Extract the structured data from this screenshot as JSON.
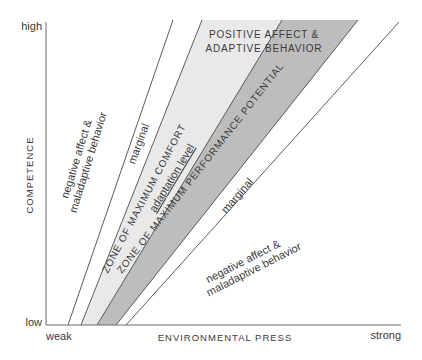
{
  "diagram": {
    "axes": {
      "y_label": "COMPETENCE",
      "y_high": "high",
      "y_low": "low",
      "x_label": "ENVIRONMENTAL PRESS",
      "x_weak": "weak",
      "x_strong": "strong"
    },
    "regions": {
      "upper_left_negative_line1": "negative affect &",
      "upper_left_negative_line2": "maladaptive behavior",
      "upper_marginal": "marginal",
      "comfort_zone": "ZONE OF MAXIMUM COMFORT",
      "adaptation_level": "adaptation level",
      "performance_zone": "ZONE OF MAXIMUM PERFORMANCE POTENTIAL",
      "positive_line1": "POSITIVE AFFECT &",
      "positive_line2": "ADAPTIVE BEHAVIOR",
      "lower_marginal": "marginal",
      "lower_right_negative_line1": "negative affect &",
      "lower_right_negative_line2": "maladaptive behavior"
    },
    "colors": {
      "comfort_fill": "#e9e9e9",
      "performance_fill": "#bdbdbd",
      "line": "#4a4a4a",
      "axis": "#6a6a6a",
      "text": "#3a3a3a"
    }
  }
}
